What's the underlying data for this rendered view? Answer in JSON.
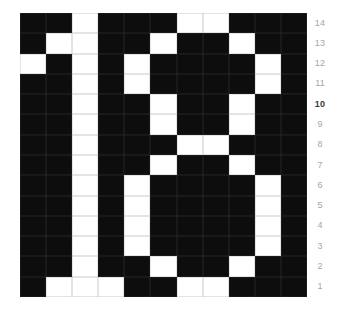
{
  "figure": {
    "depicts": "Binary pixel-grid figure rendering the numeral 18 as white cells on a black background",
    "value_shown": "18",
    "highlighted_row_label": "10"
  },
  "grid": {
    "cols": 11,
    "rows": 14,
    "on_color": "#ffffff",
    "off_color": "#0d0d0d",
    "gridline_on_cells": "#c9c9c9",
    "gridline_off_cells": "#272727",
    "pattern": [
      "00100011000",
      "01100100100",
      "10101000010",
      "00101000010",
      "00100100100",
      "00100100100",
      "00100011000",
      "00100100100",
      "00101000010",
      "00101000010",
      "00101000010",
      "00101000010",
      "00100100100",
      "01110011000"
    ]
  },
  "row_labels": {
    "color": "#a6a6a6",
    "bold_color": "#3a3a3a",
    "items": [
      {
        "text": "14",
        "bold": false
      },
      {
        "text": "13",
        "bold": false
      },
      {
        "text": "12",
        "bold": false
      },
      {
        "text": "11",
        "bold": false
      },
      {
        "text": "10",
        "bold": true
      },
      {
        "text": "9",
        "bold": false
      },
      {
        "text": "8",
        "bold": false
      },
      {
        "text": "7",
        "bold": false
      },
      {
        "text": "6",
        "bold": false
      },
      {
        "text": "5",
        "bold": false
      },
      {
        "text": "4",
        "bold": false
      },
      {
        "text": "3",
        "bold": false
      },
      {
        "text": "2",
        "bold": false
      },
      {
        "text": "1",
        "bold": false
      }
    ]
  },
  "chart_data": {
    "type": "heatmap",
    "title": "",
    "xlabel": "",
    "ylabel": "",
    "y_tick_labels_top_to_bottom": [
      "14",
      "13",
      "12",
      "11",
      "10",
      "9",
      "8",
      "7",
      "6",
      "5",
      "4",
      "3",
      "2",
      "1"
    ],
    "y_tick_side": "right",
    "bold_y_tick": "10",
    "x_tick_labels": [],
    "grid": true,
    "legend": "none",
    "value_meaning": {
      "1": "white (on)",
      "0": "black (off)"
    },
    "annotation": "White cells form the numeral 18",
    "matrix_rows_top_to_bottom": [
      [
        0,
        0,
        1,
        0,
        0,
        0,
        1,
        1,
        0,
        0,
        0
      ],
      [
        0,
        1,
        1,
        0,
        0,
        1,
        0,
        0,
        1,
        0,
        0
      ],
      [
        1,
        0,
        1,
        0,
        1,
        0,
        0,
        0,
        0,
        1,
        0
      ],
      [
        0,
        0,
        1,
        0,
        1,
        0,
        0,
        0,
        0,
        1,
        0
      ],
      [
        0,
        0,
        1,
        0,
        0,
        1,
        0,
        0,
        1,
        0,
        0
      ],
      [
        0,
        0,
        1,
        0,
        0,
        1,
        0,
        0,
        1,
        0,
        0
      ],
      [
        0,
        0,
        1,
        0,
        0,
        0,
        1,
        1,
        0,
        0,
        0
      ],
      [
        0,
        0,
        1,
        0,
        0,
        1,
        0,
        0,
        1,
        0,
        0
      ],
      [
        0,
        0,
        1,
        0,
        1,
        0,
        0,
        0,
        0,
        1,
        0
      ],
      [
        0,
        0,
        1,
        0,
        1,
        0,
        0,
        0,
        0,
        1,
        0
      ],
      [
        0,
        0,
        1,
        0,
        1,
        0,
        0,
        0,
        0,
        1,
        0
      ],
      [
        0,
        0,
        1,
        0,
        1,
        0,
        0,
        0,
        0,
        1,
        0
      ],
      [
        0,
        0,
        1,
        0,
        0,
        1,
        0,
        0,
        1,
        0,
        0
      ],
      [
        0,
        1,
        1,
        1,
        0,
        0,
        1,
        1,
        0,
        0,
        0
      ]
    ]
  }
}
